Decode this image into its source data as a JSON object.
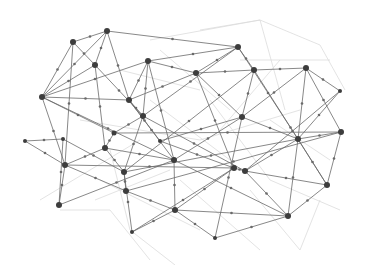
{
  "diagram": {
    "type": "network-mesh",
    "width": 367,
    "height": 265,
    "colors": {
      "background": "#ffffff",
      "edge": "#6a6a6a",
      "faint_edge": "#dcdcdc",
      "node": "#3d3d3d"
    },
    "nodes": [
      {
        "id": "A",
        "x": 107,
        "y": 31,
        "r": 3
      },
      {
        "id": "B",
        "x": 73,
        "y": 42,
        "r": 3
      },
      {
        "id": "C",
        "x": 95,
        "y": 65,
        "r": 3
      },
      {
        "id": "D",
        "x": 42,
        "y": 97,
        "r": 3
      },
      {
        "id": "E",
        "x": 148,
        "y": 61,
        "r": 3
      },
      {
        "id": "F",
        "x": 238,
        "y": 47,
        "r": 3
      },
      {
        "id": "G",
        "x": 196,
        "y": 73,
        "r": 3
      },
      {
        "id": "H",
        "x": 254,
        "y": 70,
        "r": 3
      },
      {
        "id": "I",
        "x": 306,
        "y": 68,
        "r": 3
      },
      {
        "id": "J",
        "x": 129,
        "y": 100,
        "r": 3
      },
      {
        "id": "K",
        "x": 143,
        "y": 116,
        "r": 3
      },
      {
        "id": "L",
        "x": 114,
        "y": 133,
        "r": 2.5
      },
      {
        "id": "M",
        "x": 105,
        "y": 148,
        "r": 3
      },
      {
        "id": "N",
        "x": 65,
        "y": 165,
        "r": 3
      },
      {
        "id": "O",
        "x": 59,
        "y": 205,
        "r": 3
      },
      {
        "id": "P",
        "x": 124,
        "y": 172,
        "r": 3
      },
      {
        "id": "Q",
        "x": 126,
        "y": 191,
        "r": 3
      },
      {
        "id": "R",
        "x": 174,
        "y": 160,
        "r": 3
      },
      {
        "id": "S",
        "x": 242,
        "y": 117,
        "r": 3
      },
      {
        "id": "T",
        "x": 341,
        "y": 132,
        "r": 3
      },
      {
        "id": "U",
        "x": 298,
        "y": 139,
        "r": 3
      },
      {
        "id": "V",
        "x": 234,
        "y": 168,
        "r": 3
      },
      {
        "id": "W",
        "x": 245,
        "y": 171,
        "r": 3
      },
      {
        "id": "X",
        "x": 327,
        "y": 185,
        "r": 3
      },
      {
        "id": "Y",
        "x": 288,
        "y": 216,
        "r": 3
      },
      {
        "id": "Z",
        "x": 175,
        "y": 210,
        "r": 3
      },
      {
        "id": "AA",
        "x": 215,
        "y": 238,
        "r": 2
      },
      {
        "id": "BB",
        "x": 132,
        "y": 232,
        "r": 2
      },
      {
        "id": "CC",
        "x": 25,
        "y": 141,
        "r": 2
      },
      {
        "id": "DD",
        "x": 340,
        "y": 91,
        "r": 2
      },
      {
        "id": "EE",
        "x": 63,
        "y": 139,
        "r": 2
      },
      {
        "id": "FF",
        "x": 160,
        "y": 141,
        "r": 2
      }
    ],
    "edges": [
      [
        "A",
        "B"
      ],
      [
        "A",
        "C"
      ],
      [
        "A",
        "F"
      ],
      [
        "A",
        "J"
      ],
      [
        "A",
        "D"
      ],
      [
        "B",
        "C"
      ],
      [
        "B",
        "D"
      ],
      [
        "B",
        "N"
      ],
      [
        "C",
        "D"
      ],
      [
        "C",
        "M"
      ],
      [
        "C",
        "K"
      ],
      [
        "D",
        "J"
      ],
      [
        "D",
        "L"
      ],
      [
        "D",
        "R"
      ],
      [
        "D",
        "N"
      ],
      [
        "D",
        "E"
      ],
      [
        "E",
        "F"
      ],
      [
        "E",
        "J"
      ],
      [
        "E",
        "K"
      ],
      [
        "E",
        "R"
      ],
      [
        "E",
        "G"
      ],
      [
        "F",
        "G"
      ],
      [
        "F",
        "H"
      ],
      [
        "F",
        "U"
      ],
      [
        "F",
        "K"
      ],
      [
        "G",
        "H"
      ],
      [
        "G",
        "J"
      ],
      [
        "G",
        "S"
      ],
      [
        "G",
        "V"
      ],
      [
        "H",
        "I"
      ],
      [
        "H",
        "S"
      ],
      [
        "H",
        "P"
      ],
      [
        "H",
        "X"
      ],
      [
        "I",
        "S"
      ],
      [
        "I",
        "DD"
      ],
      [
        "I",
        "T"
      ],
      [
        "I",
        "U"
      ],
      [
        "DD",
        "U"
      ],
      [
        "DD",
        "W"
      ],
      [
        "J",
        "R"
      ],
      [
        "J",
        "K"
      ],
      [
        "K",
        "L"
      ],
      [
        "K",
        "W"
      ],
      [
        "K",
        "P"
      ],
      [
        "L",
        "M"
      ],
      [
        "L",
        "T"
      ],
      [
        "M",
        "N"
      ],
      [
        "M",
        "P"
      ],
      [
        "M",
        "R"
      ],
      [
        "N",
        "O"
      ],
      [
        "N",
        "V"
      ],
      [
        "N",
        "Q"
      ],
      [
        "N",
        "CC"
      ],
      [
        "CC",
        "EE"
      ],
      [
        "EE",
        "P"
      ],
      [
        "EE",
        "O"
      ],
      [
        "O",
        "R"
      ],
      [
        "P",
        "Q"
      ],
      [
        "P",
        "U"
      ],
      [
        "P",
        "BB"
      ],
      [
        "Q",
        "Z"
      ],
      [
        "Q",
        "T"
      ],
      [
        "R",
        "S"
      ],
      [
        "R",
        "Z"
      ],
      [
        "R",
        "Y"
      ],
      [
        "S",
        "U"
      ],
      [
        "S",
        "AA"
      ],
      [
        "S",
        "FF"
      ],
      [
        "T",
        "U"
      ],
      [
        "T",
        "X"
      ],
      [
        "U",
        "Y"
      ],
      [
        "U",
        "W"
      ],
      [
        "U",
        "X"
      ],
      [
        "V",
        "W"
      ],
      [
        "V",
        "Z"
      ],
      [
        "V",
        "BB"
      ],
      [
        "W",
        "Y"
      ],
      [
        "W",
        "X"
      ],
      [
        "X",
        "Y"
      ],
      [
        "Y",
        "Z"
      ],
      [
        "Y",
        "AA"
      ],
      [
        "Z",
        "AA"
      ],
      [
        "Z",
        "BB"
      ],
      [
        "FF",
        "J"
      ],
      [
        "FF",
        "V"
      ]
    ],
    "faint_edges": [
      [
        150,
        40,
        260,
        20
      ],
      [
        260,
        20,
        320,
        45
      ],
      [
        320,
        45,
        345,
        90
      ],
      [
        200,
        30,
        260,
        20
      ],
      [
        260,
        20,
        285,
        110
      ],
      [
        110,
        150,
        130,
        230
      ],
      [
        130,
        230,
        175,
        265
      ],
      [
        60,
        210,
        110,
        210
      ],
      [
        110,
        210,
        150,
        260
      ],
      [
        100,
        180,
        200,
        230
      ],
      [
        250,
        190,
        300,
        250
      ],
      [
        300,
        250,
        320,
        200
      ],
      [
        80,
        120,
        200,
        140
      ],
      [
        200,
        140,
        300,
        110
      ],
      [
        120,
        70,
        200,
        90
      ],
      [
        210,
        100,
        270,
        180
      ],
      [
        270,
        180,
        340,
        210
      ],
      [
        40,
        200,
        140,
        140
      ],
      [
        180,
        180,
        260,
        250
      ],
      [
        240,
        60,
        330,
        60
      ],
      [
        150,
        100,
        230,
        160
      ],
      [
        95,
        200,
        170,
        170
      ],
      [
        220,
        130,
        280,
        60
      ],
      [
        160,
        50,
        230,
        110
      ],
      [
        270,
        120,
        330,
        160
      ]
    ]
  }
}
